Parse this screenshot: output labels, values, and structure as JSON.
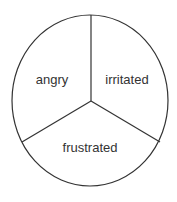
{
  "diagram": {
    "type": "three-segment circle",
    "segments": [
      {
        "label": "angry",
        "x": 52,
        "y": 79
      },
      {
        "label": "irritated",
        "x": 127,
        "y": 79
      },
      {
        "label": "frustrated",
        "x": 90,
        "y": 147
      }
    ],
    "stroke_color": "#333333"
  }
}
